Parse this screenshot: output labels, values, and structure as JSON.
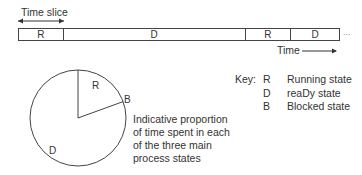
{
  "timeline": {
    "time_slice_label": "Time slice",
    "segments": [
      {
        "state": "R",
        "width": 45
      },
      {
        "state": "D",
        "width": 183
      },
      {
        "state": "R",
        "width": 46
      },
      {
        "state": "D",
        "width": 48
      }
    ],
    "continuation": "...",
    "time_label": "Time"
  },
  "pie": {
    "slices": [
      {
        "state": "R",
        "label": "R",
        "start_deg": 0,
        "end_deg": 70
      },
      {
        "state": "B",
        "label": "B",
        "start_deg": 70,
        "end_deg": 72
      },
      {
        "state": "D",
        "label": "D",
        "start_deg": 72,
        "end_deg": 360
      }
    ],
    "description_lines": [
      "Indicative proportion",
      "of time spent in each",
      "of the three main",
      "process states"
    ]
  },
  "key": {
    "heading": "Key:",
    "items": [
      {
        "code": "R",
        "meaning": "Running state"
      },
      {
        "code": "D",
        "meaning": "reaDy state"
      },
      {
        "code": "B",
        "meaning": "Blocked state"
      }
    ]
  },
  "colors": {
    "line": "#444444",
    "text": "#333333",
    "background": "#ffffff"
  }
}
